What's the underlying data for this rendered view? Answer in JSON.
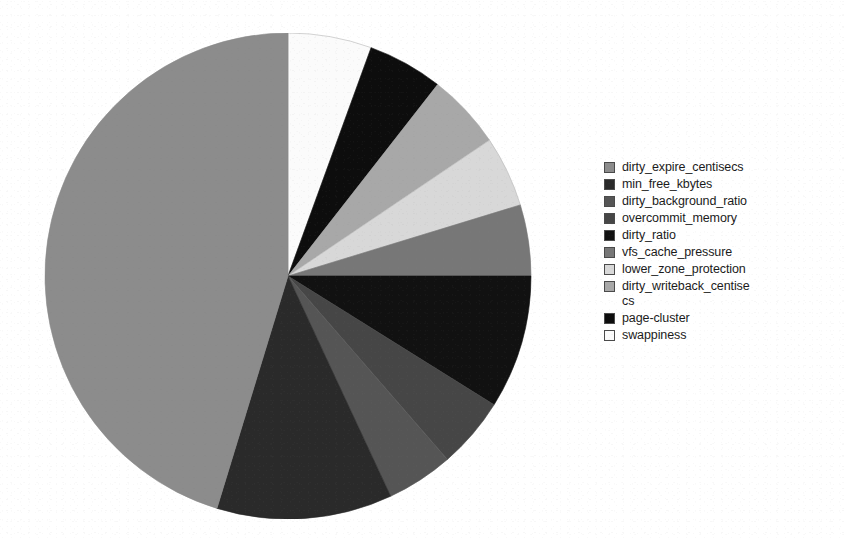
{
  "chart_data": {
    "type": "pie",
    "title": "",
    "subtitle": "",
    "xlabel": "",
    "ylabel": "",
    "grid": false,
    "legend_position": "right",
    "start_angle_deg": 0,
    "direction": "clockwise",
    "center": {
      "x": 288,
      "y": 276
    },
    "radius": 243,
    "categories": [
      "dirty_expire_centisecs",
      "min_free_kbytes",
      "dirty_background_ratio",
      "overcommit_memory",
      "dirty_ratio",
      "vfs_cache_pressure",
      "lower_zone_protection",
      "dirty_writeback_centisecs",
      "page-cluster",
      "swappiness"
    ],
    "values": [
      45.3,
      11.7,
      4.4,
      4.7,
      8.9,
      4.7,
      4.7,
      5.0,
      5.0,
      5.6
    ],
    "angles_deg": [
      163.0,
      42.0,
      16.0,
      17.0,
      32.0,
      17.0,
      17.0,
      18.0,
      18.0,
      20.0
    ],
    "colors": [
      "#8c8c8c",
      "#2a2a2a",
      "#555555",
      "#464646",
      "#111111",
      "#777777",
      "#d8d8d8",
      "#a8a8a8",
      "#0d0d0d",
      "#fbfbfb"
    ],
    "slice_order_clockwise_from_12": [
      "swappiness",
      "page-cluster",
      "dirty_writeback_centisecs",
      "lower_zone_protection",
      "vfs_cache_pressure",
      "dirty_ratio",
      "overcommit_memory",
      "dirty_background_ratio",
      "min_free_kbytes",
      "dirty_expire_centisecs"
    ]
  },
  "legend": {
    "items": [
      {
        "label": "dirty_expire_centisecs",
        "color": "#8c8c8c"
      },
      {
        "label": "min_free_kbytes",
        "color": "#2a2a2a"
      },
      {
        "label": "dirty_background_ratio",
        "color": "#555555"
      },
      {
        "label": "overcommit_memory",
        "color": "#464646"
      },
      {
        "label": "dirty_ratio",
        "color": "#111111"
      },
      {
        "label": "vfs_cache_pressure",
        "color": "#777777"
      },
      {
        "label": "lower_zone_protection",
        "color": "#d8d8d8"
      },
      {
        "label": "dirty_writeback_centise\ncs",
        "color": "#a8a8a8"
      },
      {
        "label": "page-cluster",
        "color": "#0d0d0d"
      },
      {
        "label": "swappiness",
        "color": "#fbfbfb"
      }
    ]
  }
}
